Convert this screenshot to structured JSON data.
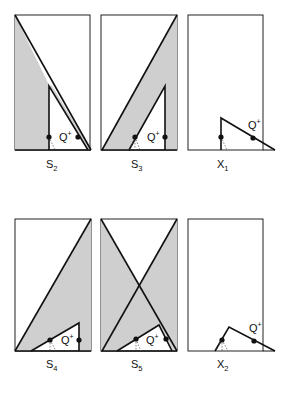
{
  "figure": {
    "panels": [
      {
        "id": "S2",
        "letter": "S",
        "subscript": "2",
        "annotation": "Q",
        "annotation_sup": "+",
        "shaded": true
      },
      {
        "id": "S3",
        "letter": "S",
        "subscript": "3",
        "annotation": "Q",
        "annotation_sup": "+",
        "shaded": true
      },
      {
        "id": "X1",
        "letter": "X",
        "subscript": "1",
        "annotation": "Q",
        "annotation_sup": "+",
        "shaded": false
      },
      {
        "id": "S4",
        "letter": "S",
        "subscript": "4",
        "annotation": "Q",
        "annotation_sup": "+",
        "shaded": true
      },
      {
        "id": "S5",
        "letter": "S",
        "subscript": "5",
        "annotation": "Q",
        "annotation_sup": "+",
        "shaded": true
      },
      {
        "id": "X2",
        "letter": "X",
        "subscript": "2",
        "annotation": "Q",
        "annotation_sup": "+",
        "shaded": false
      }
    ],
    "colors": {
      "shade": "#cfcfcf",
      "line": "#111111",
      "background": "#ffffff"
    }
  }
}
